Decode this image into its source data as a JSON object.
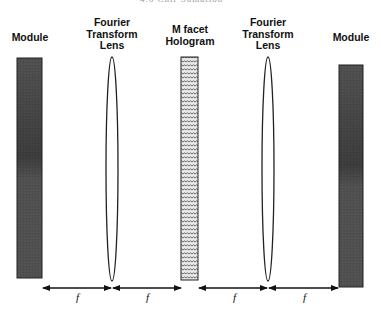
{
  "header": {
    "running_head": "4.6 Chir Sumation",
    "page_number": "53"
  },
  "labels": {
    "left_module": "Module",
    "lens_1": [
      "Fourier",
      "Transform",
      "Lens"
    ],
    "hologram": [
      "M facet",
      "Hologram"
    ],
    "lens_2": [
      "Fourier",
      "Transform",
      "Lens"
    ],
    "right_module": "Module"
  },
  "distances": {
    "f1": "f",
    "f2": "f",
    "f3": "f",
    "f4": "f"
  },
  "colors": {
    "module_fill": "#4a4a4a",
    "hologram_fill": "#bdbdbd",
    "lens_stroke": "#222222",
    "arrow": "#111111"
  }
}
